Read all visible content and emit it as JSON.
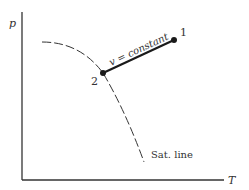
{
  "diagram": {
    "type": "p-T phase diagram",
    "axes": {
      "y_label": "p",
      "x_label": "T"
    },
    "points": [
      {
        "id": "1",
        "label": "1"
      },
      {
        "id": "2",
        "label": "2"
      }
    ],
    "process_line": {
      "label": "v = constant",
      "from": "2",
      "to": "1"
    },
    "saturation_curve": {
      "label": "Sat. line",
      "style": "dashed"
    },
    "colors": {
      "line": "#1a1a1a",
      "axis": "#333333",
      "text": "#333333",
      "background": "#ffffff"
    }
  }
}
